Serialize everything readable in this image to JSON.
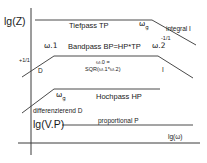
{
  "diagram": {
    "type": "bode-magnitude-schematic",
    "axes": {
      "y_label": "lg(Z)",
      "x_label": "lg(ω)",
      "gain_label": "lg(V.P)"
    },
    "sections": {
      "lowpass": {
        "label": "Tiefpass TP",
        "corner_freq": "ω",
        "corner_freq_sub": "g",
        "slope_label": "-1/1",
        "behavior_label": "integral I"
      },
      "bandpass": {
        "label": "Bandpass BP=HP*TP",
        "lower_corner": "ω.1",
        "upper_corner": "ω.2",
        "slope_label": "+1/1",
        "left_behavior": "D",
        "right_behavior": "I",
        "formula_line1": "ω.0 =",
        "formula_line2": "SQR(ω.1*ω.2)"
      },
      "highpass": {
        "label": "Hochpass HP",
        "corner_freq": "ω",
        "corner_freq_sub": "g",
        "behavior_label": "differenzierend D"
      },
      "proportional": {
        "label": "proportional P"
      }
    }
  }
}
